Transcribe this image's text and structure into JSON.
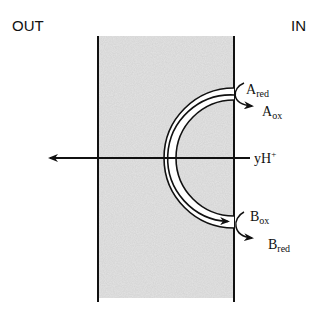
{
  "labels": {
    "out": "OUT",
    "in": "IN",
    "a_red_main": "A",
    "a_red_sub": "red",
    "a_ox_main": "A",
    "a_ox_sub": "ox",
    "b_ox_main": "B",
    "b_ox_sub": "ox",
    "b_red_main": "B",
    "b_red_sub": "red",
    "proton_main": "yH",
    "proton_sup": "+"
  },
  "colors": {
    "membrane_fill": "#d6d6d6",
    "line": "#111111"
  }
}
